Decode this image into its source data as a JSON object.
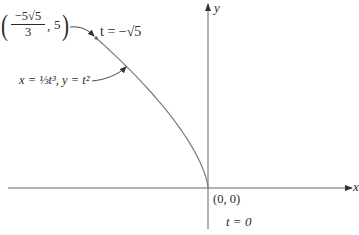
{
  "figure": {
    "type": "parametric-curve-diagram",
    "axes": {
      "x_label": "x",
      "y_label": "y"
    },
    "curve": {
      "equation_label": "x = ⅓t³, y = t²",
      "x_of_t": "t^3/3",
      "y_of_t": "t^2",
      "t_range": [
        -2.2360679775,
        0
      ]
    },
    "points": [
      {
        "name": "start",
        "coord_label": "(−5√5/3, 5)",
        "coord_numerator": "−5√5",
        "coord_denominator": "3",
        "coord_y": "5",
        "param_label": "t = −√5",
        "x": -3.7268,
        "y": 5
      },
      {
        "name": "origin",
        "coord_label": "(0, 0)",
        "param_label": "t = 0",
        "x": 0,
        "y": 0
      }
    ],
    "colors": {
      "curve": "#7a7a7a",
      "axis": "#555555",
      "text": "#2a2a2a",
      "point": "#6e6e6e"
    }
  }
}
